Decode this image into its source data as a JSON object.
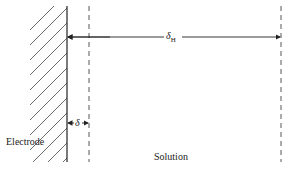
{
  "diagram": {
    "labels": {
      "electrode": "Electrode",
      "solution": "Solution",
      "delta": "δ",
      "delta_h": "δ",
      "delta_h_sub": "H"
    },
    "colors": {
      "line": "#333333",
      "background": "#ffffff"
    }
  }
}
